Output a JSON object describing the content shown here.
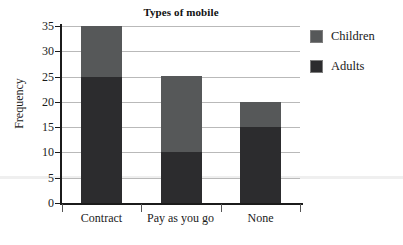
{
  "chart_data": {
    "type": "bar",
    "subtype": "stacked",
    "title": "Types of mobile",
    "xlabel": "",
    "ylabel": "Frequency",
    "categories": [
      "Contract",
      "Pay as you go",
      "None"
    ],
    "series": [
      {
        "name": "Adults",
        "values": [
          25,
          10,
          15
        ],
        "color": "#2c2c2e"
      },
      {
        "name": "Children",
        "values": [
          10,
          15,
          5
        ],
        "color": "#565859"
      }
    ],
    "totals": [
      35,
      25,
      20
    ],
    "ylim": [
      0,
      35
    ],
    "yticks": [
      0,
      5,
      10,
      15,
      20,
      25,
      30,
      35
    ],
    "ytick_labels": [
      "0",
      "5",
      "10",
      "15",
      "20",
      "25",
      "30",
      "35"
    ],
    "grid": true,
    "grid_axis": "y",
    "legend_position": "right",
    "legend_entries": [
      "Children",
      "Adults"
    ],
    "stack_order_bottom_to_top": [
      "Adults",
      "Children"
    ],
    "background_color": "#ffffff",
    "axis_color": "#1b1b1b",
    "gridline_color": "#b9b9b9"
  }
}
